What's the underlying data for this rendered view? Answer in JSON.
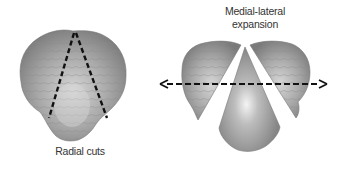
{
  "figure": {
    "panels": [
      {
        "id": "left",
        "description": "Intact cerebellum with two radial cut lines (dashed) forming a wedge",
        "label": "Radial cuts"
      },
      {
        "id": "right",
        "description": "Cerebellum split into three pieces after radial cuts, spread apart with a double-headed dashed arrow",
        "label_line1": "Medial-lateral",
        "label_line2": "expansion"
      }
    ],
    "colors": {
      "tissue_light": "#c8c8c8",
      "tissue_mid": "#9a9a9a",
      "tissue_dark": "#6f6f6f",
      "dash": "#111111",
      "text": "#333333",
      "background": "#ffffff"
    }
  }
}
